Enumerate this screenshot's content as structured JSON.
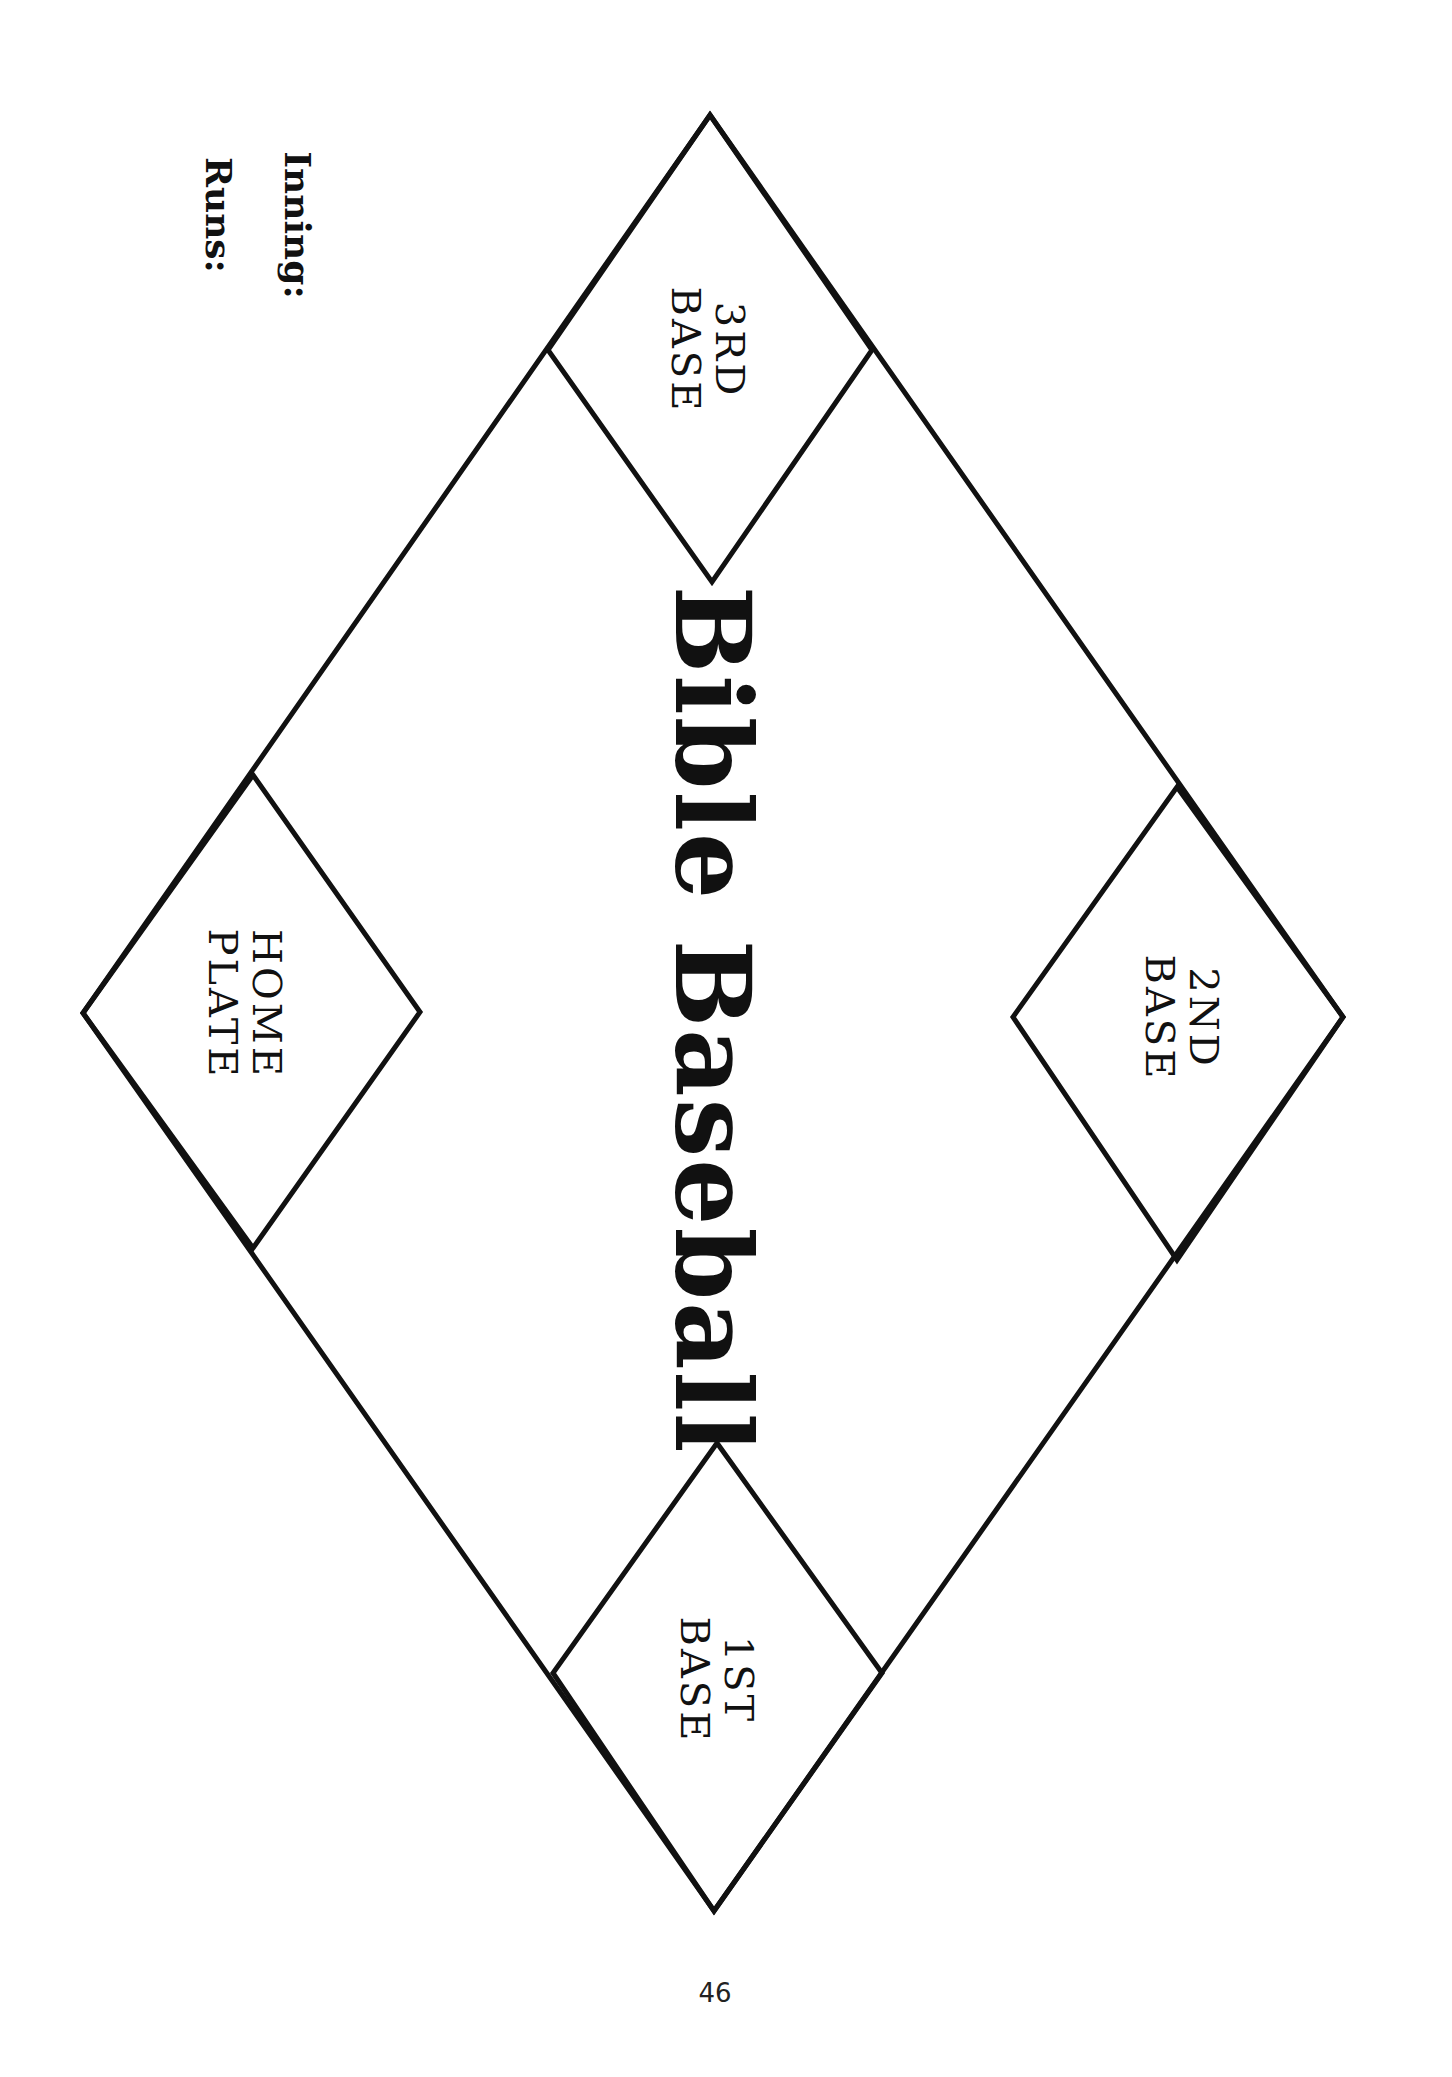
{
  "page": {
    "title": "Bible Baseball",
    "page_number": "46",
    "scoreboard": {
      "inning_label": "Inning:",
      "runs_label": "Runs:"
    },
    "bases": {
      "third": {
        "line1": "3RD",
        "line2": "BASE"
      },
      "second": {
        "line1": "2ND",
        "line2": "BASE"
      },
      "first": {
        "line1": "1ST",
        "line2": "BASE"
      },
      "home": {
        "line1": "HOME",
        "line2": "PLATE"
      }
    },
    "colors": {
      "ink": "#111111",
      "paper": "#ffffff"
    }
  }
}
